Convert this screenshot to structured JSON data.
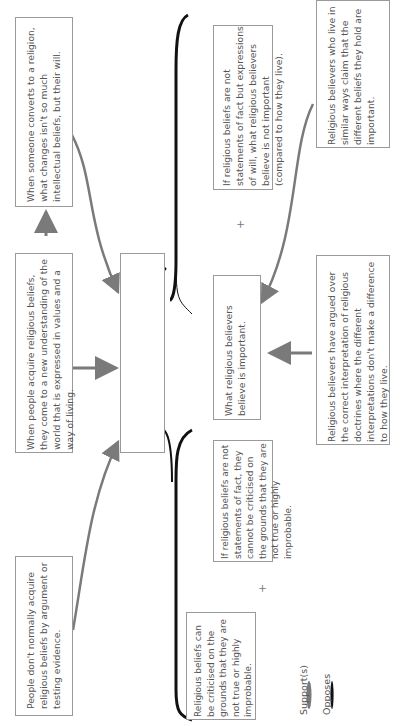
{
  "diagram": {
    "type": "argument-map",
    "orientation": "rotated-90-ccw",
    "central_claim": "'God exists' is not a statement of fact, but an expression of a non-cognitive attitude.",
    "boxes": {
      "conversion": "When someone converts to a religion, what changes isn't so much intellectual beliefs, but their will.",
      "acquire_values": "When people acquire religious beliefs, they come to a new understanding of the world that is expressed in values and a way of living.",
      "no_argument": "People don't normally acquire religious beliefs by argument or testing evidence.",
      "not_important": "If religious beliefs are not statements of fact but expressions of will, what religious believers believe is not important (compared to how they live).",
      "belief_important": "What religious believers believe is important.",
      "argued_over": "Religious believers have argued over the correct interpretation of religious doctrines where the different interpretations don't make a difference to how they live.",
      "similar_ways": "Religious believers who live in similar ways claim that the different beliefs they hold are important.",
      "cannot_criticise": "If religious beliefs are not statements of fact, they cannot be criticised on the grounds that they are not true or highly improbable.",
      "can_criticise": "Religious beliefs can be criticised on the grounds that they are not true or highly improbable."
    },
    "combinator": "+",
    "legend": {
      "supports": "Support(s)",
      "opposes": "Opposes"
    },
    "colors": {
      "support_arrow": "#7a7a7a",
      "oppose_arrow": "#111111",
      "box_border": "#9a9a9a",
      "text": "#555555"
    }
  }
}
